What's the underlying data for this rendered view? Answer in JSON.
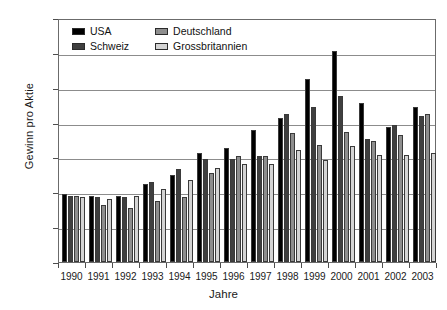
{
  "chart_data": {
    "type": "bar",
    "title": "",
    "xlabel": "Jahre",
    "ylabel": "Gewinn pro Aktie",
    "categories": [
      "1990",
      "1991",
      "1992",
      "1993",
      "1994",
      "1995",
      "1996",
      "1997",
      "1998",
      "1999",
      "2000",
      "2001",
      "2002",
      "2003"
    ],
    "ylim": [
      0,
      350
    ],
    "yticks": [
      0,
      50,
      100,
      150,
      200,
      250,
      300,
      350
    ],
    "grid": true,
    "legend_position": "top-left-inside",
    "series": [
      {
        "name": "USA",
        "color": "#000000",
        "values": [
          97,
          95,
          95,
          112,
          125,
          157,
          163,
          190,
          207,
          262,
          302,
          228,
          193,
          222
        ]
      },
      {
        "name": "Schweiz",
        "color": "#3f3f3f",
        "values": [
          95,
          93,
          93,
          115,
          133,
          148,
          148,
          152,
          212,
          222,
          238,
          177,
          197,
          210
        ]
      },
      {
        "name": "Deutschland",
        "color": "#8e8e8e",
        "values": [
          95,
          82,
          77,
          88,
          93,
          127,
          152,
          152,
          185,
          168,
          187,
          173,
          182,
          212
        ]
      },
      {
        "name": "Grossbritannien",
        "color": "#d4d4d4",
        "values": [
          93,
          90,
          95,
          105,
          118,
          135,
          141,
          140,
          160,
          147,
          166,
          153,
          153,
          157
        ]
      }
    ]
  }
}
